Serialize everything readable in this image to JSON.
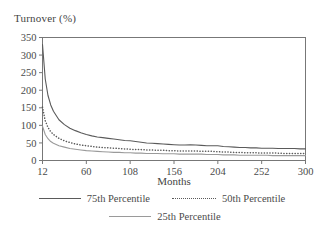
{
  "chart_data": {
    "type": "line",
    "title": "",
    "xlabel": "Months",
    "ylabel": "Turnover (%)",
    "xlim": [
      12,
      300
    ],
    "ylim": [
      0,
      350
    ],
    "xticks": [
      12,
      60,
      108,
      156,
      204,
      252,
      300
    ],
    "yticks": [
      0,
      50,
      100,
      150,
      200,
      250,
      300,
      350
    ],
    "grid": false,
    "legend_position": "below",
    "x": [
      12,
      15,
      18,
      21,
      24,
      30,
      36,
      42,
      48,
      54,
      60,
      66,
      72,
      78,
      84,
      90,
      96,
      102,
      108,
      114,
      120,
      126,
      132,
      138,
      144,
      150,
      156,
      162,
      168,
      174,
      180,
      186,
      192,
      198,
      204,
      210,
      216,
      222,
      228,
      234,
      240,
      246,
      252,
      258,
      264,
      270,
      276,
      282,
      288,
      294,
      300
    ],
    "series": [
      {
        "name": "75th Percentile",
        "style": "solid",
        "color": "#5a5a5a",
        "values": [
          330,
          232,
          185,
          158,
          140,
          116,
          102,
          92,
          85,
          79,
          74,
          70,
          67,
          65,
          63,
          61,
          59,
          57,
          56,
          54,
          52,
          50,
          49,
          48,
          47,
          46,
          45,
          44,
          44,
          45,
          44,
          43,
          42,
          42,
          42,
          40,
          39,
          38,
          37,
          37,
          36,
          36,
          35,
          35,
          35,
          34,
          34,
          34,
          34,
          33,
          33
        ]
      },
      {
        "name": "50th Percentile",
        "style": "dotted",
        "color": "#5a5a5a",
        "values": [
          152,
          113,
          94,
          82,
          74,
          63,
          56,
          51,
          47,
          44,
          42,
          40,
          38,
          37,
          36,
          35,
          34,
          33,
          32,
          31,
          31,
          30,
          30,
          29,
          29,
          28,
          28,
          27,
          27,
          27,
          27,
          26,
          26,
          26,
          25,
          24,
          24,
          23,
          23,
          22,
          22,
          22,
          21,
          21,
          21,
          21,
          20,
          20,
          20,
          20,
          20
        ]
      },
      {
        "name": "25th Percentile",
        "style": "solid",
        "color": "#9a9a9a",
        "values": [
          98,
          74,
          62,
          54,
          49,
          42,
          38,
          34,
          32,
          30,
          28,
          27,
          26,
          25,
          24,
          23,
          23,
          22,
          22,
          21,
          21,
          20,
          20,
          20,
          19,
          19,
          19,
          18,
          18,
          18,
          18,
          18,
          17,
          17,
          17,
          16,
          16,
          16,
          15,
          15,
          15,
          15,
          15,
          15,
          14,
          14,
          14,
          14,
          14,
          14,
          14
        ]
      }
    ]
  },
  "axes": {
    "ylabel": "Turnover (%)",
    "xlabel": "Months",
    "yticks": [
      "0",
      "50",
      "100",
      "150",
      "200",
      "250",
      "300",
      "350"
    ],
    "xticks": [
      "12",
      "60",
      "108",
      "156",
      "204",
      "252",
      "300"
    ]
  },
  "legend": {
    "items": [
      {
        "label": "75th Percentile",
        "style": "solid-dark"
      },
      {
        "label": "50th Percentile",
        "style": "dotted"
      },
      {
        "label": "25th Percentile",
        "style": "solid-light"
      }
    ]
  }
}
